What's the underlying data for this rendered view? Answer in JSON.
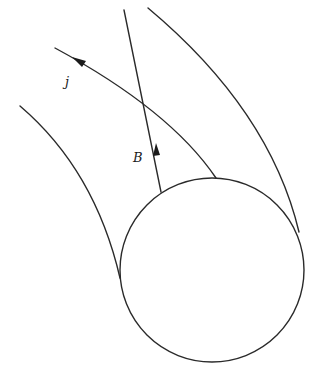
{
  "diagram": {
    "labels": {
      "current": "j",
      "field": "B"
    },
    "colors": {
      "stroke": "#2a2a2a",
      "background": "#ffffff"
    },
    "elements": [
      {
        "name": "sphere",
        "type": "circle",
        "cx": 212,
        "cy": 270,
        "r": 92
      },
      {
        "name": "left-outer-field-line",
        "type": "curve"
      },
      {
        "name": "right-outer-field-line",
        "type": "curve"
      },
      {
        "name": "field-line-B",
        "type": "line",
        "arrow": "up"
      },
      {
        "name": "current-line-j",
        "type": "curve",
        "arrow": "up-left"
      }
    ]
  }
}
